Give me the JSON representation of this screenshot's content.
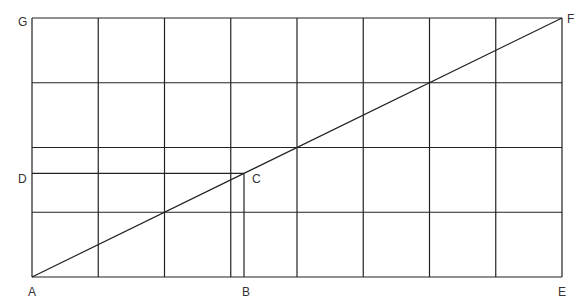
{
  "diagram": {
    "grid": {
      "columns": 8,
      "rows": 4
    },
    "points": {
      "A": {
        "label": "A",
        "grid_x": 0,
        "grid_y": 0
      },
      "B": {
        "label": "B",
        "grid_x": 3.2,
        "grid_y": 0
      },
      "C": {
        "label": "C",
        "grid_x": 3.2,
        "grid_y": 1.6
      },
      "D": {
        "label": "D",
        "grid_x": 0,
        "grid_y": 1.6
      },
      "E": {
        "label": "E",
        "grid_x": 8,
        "grid_y": 0
      },
      "F": {
        "label": "F",
        "grid_x": 8,
        "grid_y": 4
      },
      "G": {
        "label": "G",
        "grid_x": 0,
        "grid_y": 4
      }
    },
    "segments": [
      {
        "name": "diagonal-AF",
        "from": "A",
        "to": "F"
      },
      {
        "name": "segment-DC",
        "from": "D",
        "to": "C"
      },
      {
        "name": "segment-BC",
        "from": "B",
        "to": "C"
      }
    ]
  }
}
